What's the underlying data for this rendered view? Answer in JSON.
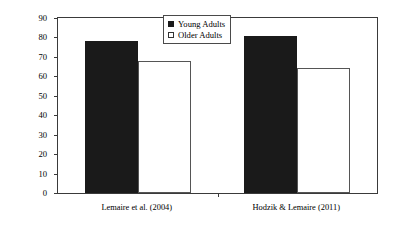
{
  "chart_data": {
    "type": "bar",
    "title": "",
    "xlabel": "",
    "ylabel": "Percentages of Best Strategy Selection",
    "ylim": [
      0,
      90
    ],
    "yticks": [
      0,
      10,
      20,
      30,
      40,
      50,
      60,
      70,
      80,
      90
    ],
    "ytick_labels": [
      "0",
      "10",
      "20",
      "30",
      "40",
      "50",
      "60",
      "70",
      "80",
      "90"
    ],
    "grid": false,
    "legend_position": "top-center",
    "categories": [
      "Lemaire et al. (2004)",
      "Hodzik & Lemaire (2011)"
    ],
    "series": [
      {
        "name": "Young Adults",
        "swatch": "filled-square",
        "color": "#1a1a1a",
        "values": [
          78,
          80.5
        ]
      },
      {
        "name": "Older Adults",
        "swatch": "open-square",
        "color": "#ffffff",
        "values": [
          68,
          64.5
        ]
      }
    ]
  },
  "legend": {
    "items": [
      {
        "label": "Young Adults"
      },
      {
        "label": "Older Adults"
      }
    ]
  },
  "axes": {
    "y_title": "Percentages of Best Strategy Selection"
  }
}
